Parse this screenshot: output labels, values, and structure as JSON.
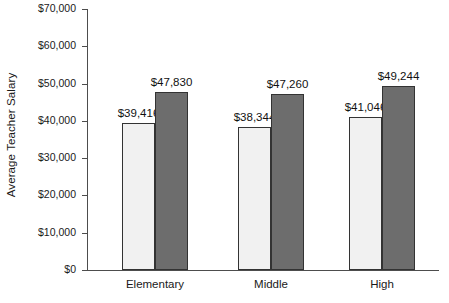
{
  "chart_data": {
    "type": "bar",
    "title": "",
    "subtitle": "",
    "xlabel": "",
    "ylabel": "Average Teacher Salary",
    "categories": [
      "Elementary",
      "Middle",
      "High"
    ],
    "series": [
      {
        "name": "series-1",
        "values": [
          39416,
          38344,
          41046
        ],
        "color": "#f1f1f1"
      },
      {
        "name": "series-2",
        "values": [
          47830,
          47260,
          49244
        ],
        "color": "#6d6d6d"
      }
    ],
    "data_labels": [
      [
        "$39,416",
        "$38,344",
        "$41,046"
      ],
      [
        "$47,830",
        "$47,260",
        "$49,244"
      ]
    ],
    "ylim": [
      0,
      70000
    ],
    "ytick_values": [
      0,
      10000,
      20000,
      30000,
      40000,
      50000,
      60000,
      70000
    ],
    "ytick_labels": [
      "$0",
      "$10,000",
      "$20,000",
      "$30,000",
      "$40,000",
      "$50,000",
      "$60,000",
      "$70,000"
    ],
    "grid": false,
    "legend": "none",
    "axis_color": "#4d4d4d",
    "bar_border_color": "#333333",
    "text_color": "#1a1a1a"
  }
}
